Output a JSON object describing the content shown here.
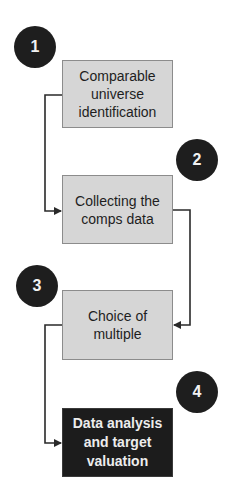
{
  "diagram": {
    "type": "flowchart",
    "steps": [
      {
        "number": "1",
        "label": "Comparable\nuniverse\nidentification",
        "style": "light"
      },
      {
        "number": "2",
        "label": "Collecting the\ncomps data",
        "style": "light"
      },
      {
        "number": "3",
        "label": "Choice of\nmultiple",
        "style": "light"
      },
      {
        "number": "4",
        "label": "Data analysis\nand target\nvaluation",
        "style": "dark"
      }
    ],
    "edges": [
      {
        "from": "1",
        "to": "2"
      },
      {
        "from": "2",
        "to": "3"
      },
      {
        "from": "3",
        "to": "4"
      }
    ],
    "colors": {
      "box_fill": "#d6d6d6",
      "box_border": "#8c8c8c",
      "final_box_fill": "#1c1c1c",
      "badge_fill": "#1e1e1e",
      "connector": "#2a2a2a"
    }
  }
}
